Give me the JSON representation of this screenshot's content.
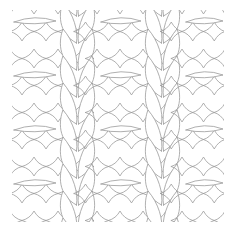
{
  "diagram": {
    "title": "",
    "description": "Knitting stitch illustration: stockinette V-stitch columns (cable ribs) separated by reverse stockinette purl bump panels",
    "colors": {
      "background": "#ffffff",
      "line": "#9a9a9a"
    },
    "panels": [
      {
        "type": "purl",
        "x_start": 10,
        "x_end": 58
      },
      {
        "type": "stockinette",
        "x_start": 55,
        "x_end": 100
      },
      {
        "type": "purl",
        "x_start": 97,
        "x_end": 143
      },
      {
        "type": "stockinette",
        "x_start": 140,
        "x_end": 185
      },
      {
        "type": "purl",
        "x_start": 182,
        "x_end": 225
      }
    ],
    "row_height": 27,
    "rows": 8
  }
}
